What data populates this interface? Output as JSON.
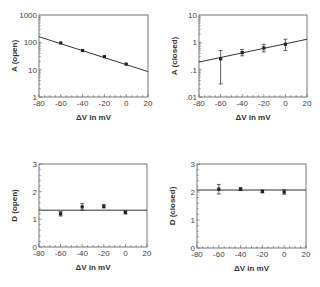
{
  "chart_data": [
    {
      "type": "scatter",
      "panel": "top-left",
      "ylabel": "A (open)",
      "xlabel": "ΔV in mV",
      "xlim": [
        -80,
        20
      ],
      "xticks": [
        -80,
        -60,
        -40,
        -20,
        0,
        20
      ],
      "yscale": "log",
      "ylim": [
        1,
        1000
      ],
      "yticks": [
        1,
        10,
        100,
        1000
      ],
      "ytick_labels": [
        "1",
        "10",
        "100",
        "1000"
      ],
      "points": [
        {
          "x": -60,
          "y": 95,
          "err_lo": 95,
          "err_hi": 95
        },
        {
          "x": -40,
          "y": 50,
          "err_lo": 50,
          "err_hi": 50
        },
        {
          "x": -20,
          "y": 30,
          "err_lo": 30,
          "err_hi": 30
        },
        {
          "x": 0,
          "y": 16,
          "err_lo": 16,
          "err_hi": 16
        }
      ],
      "fit_line": {
        "x": [
          -80,
          20
        ],
        "y": [
          160,
          8.5
        ]
      },
      "frame": {
        "left": 39,
        "top": 15,
        "right": 148,
        "bottom": 97
      }
    },
    {
      "type": "scatter",
      "panel": "top-right",
      "ylabel": "A (closed)",
      "xlabel": "ΔV in mV",
      "xlim": [
        -80,
        20
      ],
      "xticks": [
        -80,
        -60,
        -40,
        -20,
        0,
        20
      ],
      "yscale": "log",
      "ylim": [
        0.01,
        10
      ],
      "yticks": [
        0.01,
        0.1,
        1,
        10
      ],
      "ytick_labels": [
        ".01",
        ".1",
        "1",
        "10"
      ],
      "points": [
        {
          "x": -60,
          "y": 0.25,
          "err_lo": 0.03,
          "err_hi": 0.5
        },
        {
          "x": -40,
          "y": 0.42,
          "err_lo": 0.32,
          "err_hi": 0.55
        },
        {
          "x": -20,
          "y": 0.62,
          "err_lo": 0.45,
          "err_hi": 0.85
        },
        {
          "x": 0,
          "y": 0.85,
          "err_lo": 0.5,
          "err_hi": 1.3
        }
      ],
      "fit_line": {
        "x": [
          -80,
          20
        ],
        "y": [
          0.19,
          1.3
        ]
      },
      "frame": {
        "left": 199,
        "top": 15,
        "right": 307,
        "bottom": 97
      }
    },
    {
      "type": "scatter",
      "panel": "bottom-left",
      "ylabel": "D (open)",
      "xlabel": "ΔV in mV",
      "xlim": [
        -80,
        20
      ],
      "xticks": [
        -80,
        -60,
        -40,
        -20,
        0,
        20
      ],
      "yscale": "linear",
      "ylim": [
        0,
        3
      ],
      "yticks": [
        0,
        1,
        2,
        3
      ],
      "ytick_labels": [
        "0",
        "1",
        "2",
        "3"
      ],
      "points": [
        {
          "x": -60,
          "y": 1.2,
          "err_lo": 1.12,
          "err_hi": 1.28
        },
        {
          "x": -40,
          "y": 1.45,
          "err_lo": 1.33,
          "err_hi": 1.57
        },
        {
          "x": -20,
          "y": 1.47,
          "err_lo": 1.41,
          "err_hi": 1.53
        },
        {
          "x": 0,
          "y": 1.25,
          "err_lo": 1.19,
          "err_hi": 1.31
        }
      ],
      "fit_line": {
        "x": [
          -80,
          20
        ],
        "y": [
          1.33,
          1.33
        ]
      },
      "frame": {
        "left": 39,
        "top": 164,
        "right": 147,
        "bottom": 247
      }
    },
    {
      "type": "scatter",
      "panel": "bottom-right",
      "ylabel": "D (closed)",
      "xlabel": "ΔV in mV",
      "xlim": [
        -80,
        20
      ],
      "xticks": [
        -80,
        -60,
        -40,
        -20,
        0,
        20
      ],
      "yscale": "linear",
      "ylim": [
        0,
        3
      ],
      "yticks": [
        0,
        1,
        2,
        3
      ],
      "ytick_labels": [
        "0",
        "1",
        "2",
        "3"
      ],
      "points": [
        {
          "x": -60,
          "y": 2.1,
          "err_lo": 1.93,
          "err_hi": 2.27
        },
        {
          "x": -40,
          "y": 2.1,
          "err_lo": 2.05,
          "err_hi": 2.15
        },
        {
          "x": -20,
          "y": 2.02,
          "err_lo": 1.97,
          "err_hi": 2.07
        },
        {
          "x": 0,
          "y": 2.0,
          "err_lo": 1.92,
          "err_hi": 2.08
        }
      ],
      "fit_line": {
        "x": [
          -80,
          20
        ],
        "y": [
          2.07,
          2.07
        ]
      },
      "frame": {
        "left": 197,
        "top": 164,
        "right": 306,
        "bottom": 248
      }
    }
  ],
  "colors": {
    "axis": "#666666",
    "line": "#333333",
    "marker": "#222222",
    "text": "#333333"
  }
}
